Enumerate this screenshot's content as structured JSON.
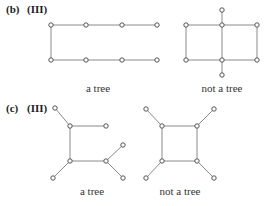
{
  "parts": [
    {
      "id": "b",
      "part_label": "(b)",
      "roman_label": "(III)",
      "label_pos": [
        6,
        13
      ],
      "roman_pos": [
        27,
        13
      ],
      "graphs": [
        {
          "caption": "a tree",
          "caption_pos": [
            98,
            92
          ],
          "nodes": [
            [
              51,
              25
            ],
            [
              86,
              25
            ],
            [
              122,
              25
            ],
            [
              157,
              25
            ],
            [
              51,
              60
            ],
            [
              86,
              60
            ],
            [
              122,
              60
            ],
            [
              157,
              60
            ]
          ],
          "edges": [
            [
              0,
              1
            ],
            [
              1,
              2
            ],
            [
              2,
              3
            ],
            [
              0,
              4
            ],
            [
              4,
              5
            ],
            [
              5,
              6
            ],
            [
              6,
              7
            ]
          ]
        },
        {
          "caption": "not a tree",
          "caption_pos": [
            222,
            92
          ],
          "nodes": [
            [
              186,
              25
            ],
            [
              222,
              25
            ],
            [
              257,
              25
            ],
            [
              186,
              60
            ],
            [
              222,
              60
            ],
            [
              257,
              60
            ],
            [
              222,
              10
            ],
            [
              222,
              75
            ]
          ],
          "edges": [
            [
              0,
              1
            ],
            [
              1,
              2
            ],
            [
              3,
              4
            ],
            [
              4,
              5
            ],
            [
              0,
              3
            ],
            [
              1,
              4
            ],
            [
              2,
              5
            ],
            [
              6,
              1
            ],
            [
              4,
              7
            ]
          ]
        }
      ]
    },
    {
      "id": "c",
      "part_label": "(c)",
      "roman_label": "(III)",
      "label_pos": [
        6,
        112
      ],
      "roman_pos": [
        27,
        112
      ],
      "graphs": [
        {
          "caption": "a tree",
          "caption_pos": [
            92,
            195
          ],
          "nodes": [
            [
              55,
              108
            ],
            [
              70,
              126
            ],
            [
              106,
              126
            ],
            [
              70,
              161
            ],
            [
              106,
              161
            ],
            [
              123,
              145
            ],
            [
              123,
              178
            ],
            [
              53,
              178
            ]
          ],
          "edges": [
            [
              0,
              1
            ],
            [
              1,
              2
            ],
            [
              1,
              3
            ],
            [
              3,
              4
            ],
            [
              4,
              5
            ],
            [
              4,
              6
            ],
            [
              3,
              7
            ]
          ]
        },
        {
          "caption": "not a tree",
          "caption_pos": [
            180,
            195
          ],
          "nodes": [
            [
              146,
              109
            ],
            [
              162,
              126
            ],
            [
              197,
              126
            ],
            [
              214,
              109
            ],
            [
              162,
              161
            ],
            [
              197,
              161
            ],
            [
              146,
              178
            ],
            [
              214,
              178
            ]
          ],
          "edges": [
            [
              0,
              1
            ],
            [
              1,
              2
            ],
            [
              2,
              3
            ],
            [
              1,
              4
            ],
            [
              2,
              5
            ],
            [
              4,
              5
            ],
            [
              4,
              6
            ],
            [
              5,
              7
            ]
          ]
        }
      ]
    }
  ]
}
